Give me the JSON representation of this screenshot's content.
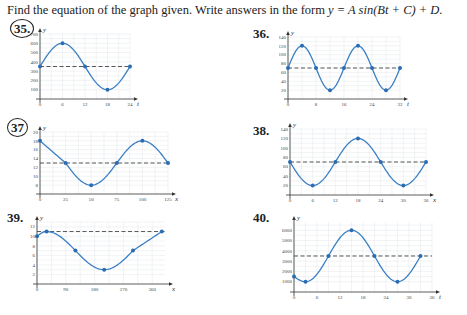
{
  "instructions": {
    "prefix": "Find the equation of the graph given. Write answers in the form ",
    "formula": "y = A sin(Bt + C) + D."
  },
  "problems": [
    {
      "number": "35.",
      "circled": true
    },
    {
      "number": "36.",
      "circled": false
    },
    {
      "number": "37",
      "circled": true
    },
    {
      "number": "38.",
      "circled": false
    },
    {
      "number": "39.",
      "circled": false
    },
    {
      "number": "40.",
      "circled": false
    }
  ],
  "chart_data": [
    {
      "id": "35",
      "type": "line",
      "xlabel": "t",
      "ylabel": "y",
      "xticks": [
        0,
        6,
        12,
        18,
        24
      ],
      "yticks": [
        100,
        200,
        300,
        400,
        500,
        600,
        700
      ],
      "xlim": [
        0,
        24
      ],
      "ylim": [
        0,
        700
      ],
      "midline": 350,
      "points": [
        [
          0,
          350
        ],
        [
          6,
          600
        ],
        [
          12,
          350
        ],
        [
          18,
          100
        ],
        [
          24,
          350
        ]
      ],
      "grid": true
    },
    {
      "id": "36",
      "type": "line",
      "xlabel": "t",
      "ylabel": "y",
      "xticks": [
        0,
        8,
        16,
        24,
        32
      ],
      "yticks": [
        20,
        40,
        60,
        80,
        100,
        120,
        140
      ],
      "xlim": [
        0,
        32
      ],
      "ylim": [
        0,
        140
      ],
      "midline": 70,
      "points": [
        [
          0,
          70
        ],
        [
          4,
          120
        ],
        [
          8,
          70
        ],
        [
          12,
          20
        ],
        [
          16,
          70
        ],
        [
          20,
          120
        ],
        [
          24,
          70
        ],
        [
          28,
          20
        ],
        [
          32,
          70
        ]
      ],
      "grid": true
    },
    {
      "id": "37",
      "type": "line",
      "xlabel": "x",
      "ylabel": "y",
      "xticks": [
        0,
        25,
        50,
        75,
        100,
        125
      ],
      "yticks": [
        8,
        10,
        12,
        14,
        16,
        18,
        20
      ],
      "xlim": [
        0,
        125
      ],
      "ylim": [
        6,
        20
      ],
      "midline": 13,
      "points": [
        [
          0,
          18
        ],
        [
          25,
          13
        ],
        [
          50,
          8
        ],
        [
          75,
          13
        ],
        [
          100,
          18
        ],
        [
          125,
          13
        ]
      ],
      "grid": true
    },
    {
      "id": "38",
      "type": "line",
      "xlabel": "x",
      "ylabel": "y",
      "xticks": [
        0,
        6,
        12,
        18,
        24,
        30,
        36
      ],
      "yticks": [
        20,
        40,
        60,
        80,
        100,
        120,
        140
      ],
      "xlim": [
        0,
        36
      ],
      "ylim": [
        0,
        140
      ],
      "midline": 70,
      "points": [
        [
          0,
          70
        ],
        [
          6,
          20
        ],
        [
          12,
          70
        ],
        [
          18,
          120
        ],
        [
          24,
          70
        ],
        [
          30,
          20
        ],
        [
          36,
          70
        ]
      ],
      "grid": true
    },
    {
      "id": "39",
      "type": "line",
      "xlabel": "x",
      "ylabel": "y",
      "xticks": [
        0,
        90,
        180,
        270,
        360
      ],
      "yticks": [
        2,
        4,
        6,
        8,
        10,
        12
      ],
      "xlim": [
        0,
        400
      ],
      "ylim": [
        0,
        13
      ],
      "midline": 11,
      "points": [
        [
          0,
          10
        ],
        [
          30,
          11
        ],
        [
          120,
          7
        ],
        [
          210,
          3
        ],
        [
          300,
          7
        ],
        [
          390,
          11
        ]
      ],
      "grid": true
    },
    {
      "id": "40",
      "type": "line",
      "xlabel": "t",
      "ylabel": "y",
      "xticks": [
        0,
        6,
        12,
        18,
        24,
        30,
        36
      ],
      "yticks": [
        1000,
        2000,
        3000,
        4000,
        5000,
        6000
      ],
      "xlim": [
        0,
        36
      ],
      "ylim": [
        0,
        6800
      ],
      "midline": 3500,
      "points": [
        [
          0,
          1500
        ],
        [
          3,
          1000
        ],
        [
          9,
          3500
        ],
        [
          15,
          6000
        ],
        [
          21,
          3500
        ],
        [
          27,
          1000
        ],
        [
          33,
          3500
        ]
      ],
      "grid": true
    }
  ]
}
